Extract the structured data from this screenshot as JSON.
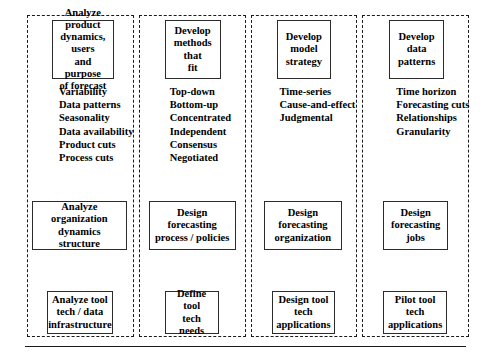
{
  "diagram": {
    "accent_color": "#000000",
    "lane_border_color": "#1a1a1a",
    "node_border_color": "#2b2b2b",
    "background_color": "#ffffff"
  },
  "lanes": [
    {
      "id": "lane-1",
      "top_box": "Analyze product\ndynamics, users\nand purpose\nof forecast",
      "attributes": [
        "Variability",
        "Data patterns",
        "Seasonality",
        "Data availability",
        "Product cuts",
        "Process cuts"
      ],
      "mid_box": "Analyze organization\ndynamics\nstructure",
      "bottom_box": "Analyze tool\ntech / data\ninfrastructure"
    },
    {
      "id": "lane-2",
      "top_box": "Develop\nmethods that\nfit",
      "attributes": [
        "Top-down",
        "Bottom-up",
        "Concentrated",
        "Independent",
        "Consensus",
        "Negotiated"
      ],
      "mid_box": "Design\nforecasting\nprocess / policies",
      "bottom_box": "Define tool\ntech\nneeds"
    },
    {
      "id": "lane-3",
      "top_box": "Develop\nmodel\nstrategy",
      "attributes": [
        "Time-series",
        "Cause-and-effect",
        "Judgmental"
      ],
      "mid_box": "Design\nforecasting\norganization",
      "bottom_box": "Design tool\ntech\napplications"
    },
    {
      "id": "lane-4",
      "top_box": "Develop\ndata\npatterns",
      "attributes": [
        "Time horizon",
        "Forecasting cuts",
        "Relationships",
        "Granularity"
      ],
      "mid_box": "Design\nforecasting\njobs",
      "bottom_box": "Pilot tool\ntech\napplications"
    }
  ]
}
